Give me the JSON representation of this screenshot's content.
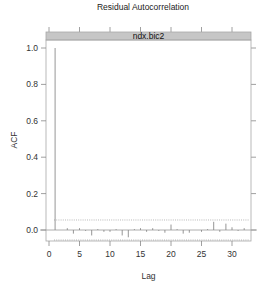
{
  "chart_data": {
    "type": "bar",
    "title": "Residual Autocorrelation",
    "panel_strip": "ndx.bic2",
    "xlabel": "Lag",
    "ylabel": "ACF",
    "xlim": [
      -0.5,
      33
    ],
    "ylim": [
      -0.09,
      1.05
    ],
    "x_ticks": [
      0,
      5,
      10,
      15,
      20,
      25,
      30
    ],
    "x_tick_labels": [
      "0",
      "5",
      "10",
      "15",
      "20",
      "25",
      "30"
    ],
    "y_ticks": [
      0.0,
      0.2,
      0.4,
      0.6,
      0.8,
      1.0
    ],
    "y_tick_labels": [
      "0.0",
      "0.2",
      "0.4",
      "0.6",
      "0.8",
      "1.0"
    ],
    "grid": false,
    "legend": null,
    "confidence_band": {
      "upper": 0.055,
      "lower": -0.055,
      "style": "dotted"
    },
    "zero_line": true,
    "lags": [
      1,
      2,
      3,
      4,
      5,
      6,
      7,
      8,
      9,
      10,
      11,
      12,
      13,
      14,
      15,
      16,
      17,
      18,
      19,
      20,
      21,
      22,
      23,
      24,
      25,
      26,
      27,
      28,
      29,
      30,
      31,
      32
    ],
    "acf": [
      1.0,
      0.0,
      0.01,
      -0.02,
      0.01,
      -0.005,
      -0.03,
      0.005,
      -0.01,
      -0.01,
      0.005,
      -0.03,
      -0.04,
      0.005,
      0.01,
      -0.01,
      0.01,
      -0.005,
      -0.015,
      0.03,
      0.005,
      -0.02,
      -0.015,
      0.0,
      -0.01,
      0.005,
      0.045,
      -0.01,
      0.035,
      0.015,
      -0.005,
      0.01
    ]
  },
  "colors": {
    "strip_bg": "#c6c6c6",
    "panel_border": "#a8a8a8",
    "bar": "#8a8a8a",
    "zero_line": "#9a9a9a",
    "band": "#9a9a9a"
  }
}
